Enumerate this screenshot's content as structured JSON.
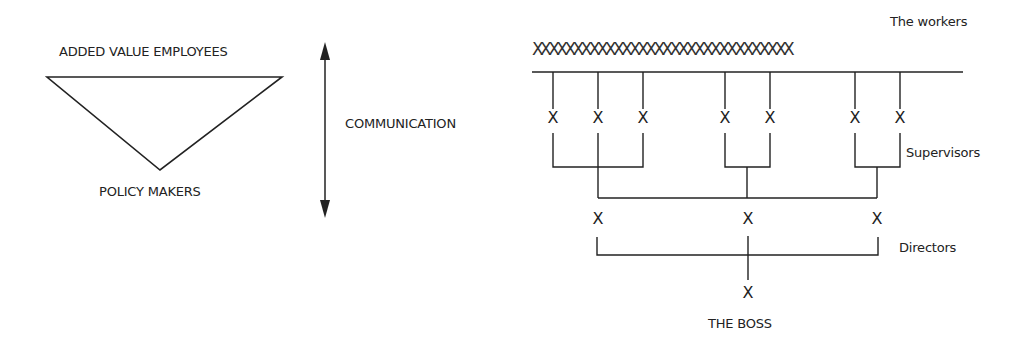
{
  "left_diagram": {
    "top_label": "ADDED VALUE EMPLOYEES",
    "bottom_label": "POLICY MAKERS",
    "shape": "inverted-triangle"
  },
  "arrow": {
    "label": "COMMUNICATION",
    "direction": "bidirectional-vertical"
  },
  "hierarchy": {
    "workers_label": "The workers",
    "workers_row": "XXXXXXXXXXXXXXXXXXXXXXXXXXXXXXXX",
    "supervisors_label": "Supervisors",
    "directors_label": "Directors",
    "boss_label": "THE BOSS",
    "node_glyph": "X",
    "supervisors": [
      "X",
      "X",
      "X",
      "X",
      "X",
      "X",
      "X"
    ],
    "directors": [
      "X",
      "X",
      "X"
    ],
    "boss": "X"
  }
}
